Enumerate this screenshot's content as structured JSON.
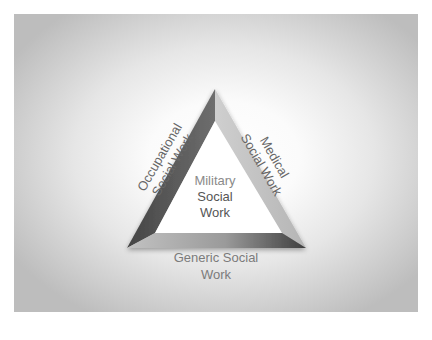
{
  "diagram": {
    "type": "triangle",
    "center": {
      "lines": [
        "Military",
        "Social",
        "Work"
      ]
    },
    "sides": {
      "left": {
        "lines": [
          "Occupational",
          "Social Work"
        ]
      },
      "right": {
        "lines": [
          "Medical",
          "Social Work"
        ]
      },
      "bottom": {
        "lines": [
          "Generic Social",
          "Work"
        ]
      }
    },
    "colors": {
      "left_face": "#5a5a5a",
      "right_face": "#c4c4c4",
      "bottom_face_light": "#b8b8b8",
      "bottom_face_dark": "#4a4a4a",
      "text": "#7a7a7a",
      "background_center": "#ffffff",
      "background_edge": "#bdbdbd"
    }
  }
}
